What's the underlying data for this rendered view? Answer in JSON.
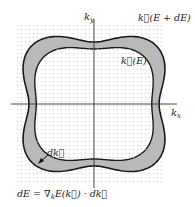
{
  "figure": {
    "axis_x_label": "k",
    "axis_x_sub": "x",
    "axis_y_label": "k",
    "axis_y_sub": "y",
    "outer_contour_label": "k⃗(E + dE)",
    "inner_contour_label": "k⃗(E)",
    "dk_label": "dk⃗",
    "equation": "dE = ∇",
    "equation_sub": "k",
    "equation_rest": "E(k⃗) · dk⃗",
    "colors": {
      "shell_fill": "#b9b9b9",
      "contour_stroke": "#1a1a1a",
      "axis": "#333333",
      "grid_dot": "#c8c8c8"
    }
  }
}
